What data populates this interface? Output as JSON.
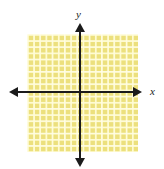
{
  "figure": {
    "name": "blank-coordinate-plane",
    "background_color": "#ffffff"
  },
  "axes": {
    "x_label": "x",
    "y_label": "y",
    "axis_color": "#1b1b1b",
    "arrow_directions": [
      "left",
      "right",
      "up",
      "down"
    ]
  },
  "grid": {
    "fill_color": "#ece07d",
    "line_color": "#fffcd6",
    "cell_size_px": 6.18,
    "columns": 18,
    "rows": 19
  },
  "chart_data": {
    "type": "scatter",
    "title": "",
    "subtitle": "",
    "xlabel": "x",
    "ylabel": "y",
    "xlim": [
      -8.5,
      9.5
    ],
    "ylim": [
      -10,
      9
    ],
    "grid": true,
    "legend": "none",
    "series": [
      {
        "name": "empty",
        "x": [],
        "y": []
      }
    ],
    "xticks": [],
    "yticks": [],
    "annotations": []
  }
}
